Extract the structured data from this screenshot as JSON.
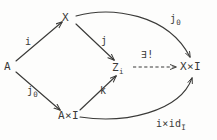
{
  "diagram": {
    "kind": "commutative-diagram",
    "background_color": "#fdfdfc",
    "ink_color": "#3a3a38",
    "nodes": [
      {
        "id": "X",
        "label": "X",
        "sub": "",
        "x": 62,
        "y": 12
      },
      {
        "id": "A",
        "label": "A",
        "sub": "",
        "x": 4,
        "y": 61
      },
      {
        "id": "Z",
        "label": "Z",
        "sub": "i",
        "x": 112,
        "y": 62
      },
      {
        "id": "AxI",
        "label": "A×I",
        "sub": "",
        "x": 58,
        "y": 110
      },
      {
        "id": "XxI",
        "label": "X×I",
        "sub": "",
        "x": 180,
        "y": 61
      }
    ],
    "edges": [
      {
        "id": "A-to-X",
        "from": "A",
        "to": "X",
        "label": "i",
        "sub": "",
        "style": "solid",
        "shape": "straight"
      },
      {
        "id": "X-to-Z",
        "from": "X",
        "to": "Z",
        "label": "j",
        "sub": "",
        "style": "solid",
        "shape": "straight"
      },
      {
        "id": "A-to-AxI",
        "from": "A",
        "to": "AxI",
        "label": "j",
        "sub": "0",
        "style": "solid",
        "shape": "straight"
      },
      {
        "id": "AxI-to-Z",
        "from": "AxI",
        "to": "Z",
        "label": "k",
        "sub": "",
        "style": "solid",
        "shape": "straight"
      },
      {
        "id": "X-to-XxI",
        "from": "X",
        "to": "XxI",
        "label": "j",
        "sub": "0",
        "style": "solid",
        "shape": "curve-over"
      },
      {
        "id": "AxI-to-XxI",
        "from": "AxI",
        "to": "XxI",
        "label": "i×id",
        "sub": "I",
        "style": "solid",
        "shape": "curve-under"
      },
      {
        "id": "Z-to-XxI",
        "from": "Z",
        "to": "XxI",
        "label": "∃!",
        "sub": "",
        "style": "dashed",
        "shape": "straight"
      }
    ],
    "labels": {
      "node_X": "X",
      "node_A": "A",
      "node_Z_base": "Z",
      "node_Z_sub": "i",
      "node_AxI": "A×I",
      "node_XxI": "X×I",
      "edge_i": "i",
      "edge_j": "j",
      "edge_j0_lower_base": "j",
      "edge_j0_lower_sub": "0",
      "edge_k": "k",
      "edge_j0_top_base": "j",
      "edge_j0_top_sub": "0",
      "edge_ixid_base": "i×id",
      "edge_ixid_sub": "I",
      "edge_exists_unique": "∃!"
    }
  }
}
